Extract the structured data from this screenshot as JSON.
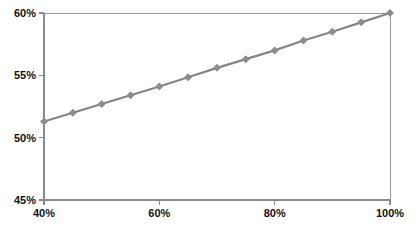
{
  "chart_data": {
    "type": "line",
    "title": "",
    "subtitle": "",
    "xlabel": "",
    "ylabel": "",
    "xlim": [
      40,
      100
    ],
    "ylim": [
      45,
      60
    ],
    "grid": false,
    "legend": false,
    "legend_position": "none",
    "x_tick_labels": [
      "40%",
      "60%",
      "80%",
      "100%"
    ],
    "x_tick_values": [
      40,
      60,
      80,
      100
    ],
    "y_tick_labels": [
      "45%",
      "50%",
      "55%",
      "60%"
    ],
    "y_tick_values": [
      45,
      50,
      55,
      60
    ],
    "x_minor_tick_values": [
      45,
      50,
      55,
      65,
      70,
      75,
      85,
      90,
      95
    ],
    "marker": "diamond",
    "series": [
      {
        "name": "series-1",
        "color": "#8c8c8c",
        "x": [
          40,
          45,
          50,
          55,
          60,
          65,
          70,
          75,
          80,
          85,
          90,
          95,
          100
        ],
        "values": [
          51.3,
          52.0,
          52.7,
          53.4,
          54.1,
          54.85,
          55.6,
          56.3,
          57.0,
          57.8,
          58.5,
          59.25,
          60.0
        ]
      }
    ],
    "annotations": []
  },
  "colors": {
    "background": "#ffffff",
    "axis": "#8a8a8a",
    "frame": "#9a9a9a",
    "series": "#8c8c8c",
    "tick_label": "#111111"
  },
  "caption": {
    "ghost_text": ""
  }
}
